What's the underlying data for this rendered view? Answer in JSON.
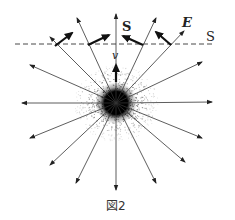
{
  "figure": {
    "caption": "図2",
    "labels": {
      "poynting": "S",
      "electric_field": "E",
      "velocity": "v",
      "surface": "S"
    },
    "colors": {
      "ink": "#222222",
      "background": "#ffffff"
    },
    "center": [
      116,
      103
    ],
    "blob_radius": 11,
    "radial_arrow_tips": [
      [
        116,
        14
      ],
      [
        77,
        18
      ],
      [
        156,
        18
      ],
      [
        50,
        37
      ],
      [
        184,
        31
      ],
      [
        30,
        65
      ],
      [
        202,
        62
      ],
      [
        22,
        103
      ],
      [
        212,
        102
      ],
      [
        30,
        138
      ],
      [
        202,
        138
      ],
      [
        50,
        165
      ],
      [
        185,
        162
      ],
      [
        76,
        183
      ],
      [
        156,
        183
      ],
      [
        116,
        190
      ]
    ],
    "surface_line": {
      "x1": 15,
      "x2": 215,
      "y": 44
    },
    "thick_arrows": [
      {
        "from": [
          55,
          46
        ],
        "to": [
          72,
          33
        ]
      },
      {
        "from": [
          88,
          45
        ],
        "to": [
          109,
          35
        ]
      },
      {
        "from": [
          143,
          45
        ],
        "to": [
          123,
          36
        ]
      },
      {
        "from": [
          171,
          45
        ],
        "to": [
          156,
          32
        ]
      }
    ],
    "velocity_arrow": {
      "from": [
        116,
        82
      ],
      "to": [
        116,
        65
      ]
    }
  }
}
